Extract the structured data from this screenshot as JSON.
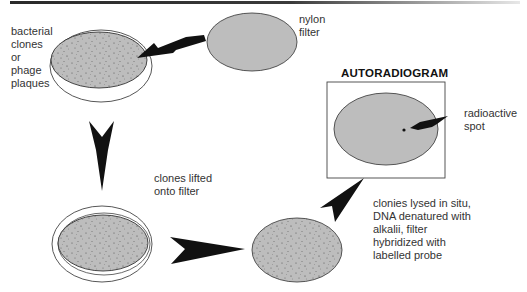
{
  "diagram": {
    "type": "process-flow",
    "labels": {
      "plate": "bacterial\nclones\nor\nphage\nplaques",
      "filter": "nylon\nfilter",
      "lift": "clones lifted\nonto filter",
      "process": "clonies lysed in situ,\nDNA denatured with\nalkalii, filter\nhybridized with\nlabelled probe",
      "autoradiogram_title": "AUTORADIOGRAM",
      "spot": "radioactive\nspot"
    },
    "nodes": [
      {
        "id": "plate-top",
        "name": "petri dish with bacterial clones or phage plaques"
      },
      {
        "id": "nylon-filter",
        "name": "nylon filter"
      },
      {
        "id": "plate-bottom",
        "name": "petri dish with filter (clones lifted)"
      },
      {
        "id": "filter-processed",
        "name": "hybridized filter"
      },
      {
        "id": "autoradiogram",
        "name": "autoradiogram with radioactive spot"
      }
    ],
    "edges": [
      {
        "from": "nylon-filter",
        "to": "plate-top"
      },
      {
        "from": "plate-top",
        "to": "plate-bottom",
        "label": "clones lifted onto filter"
      },
      {
        "from": "plate-bottom",
        "to": "filter-processed"
      },
      {
        "from": "filter-processed",
        "to": "autoradiogram",
        "label": "clonies lysed in situ, DNA denatured with alkalii, filter hybridized with labelled probe"
      }
    ],
    "colors": {
      "filter_fill": "#bdbdbd",
      "outline": "#333333",
      "arrow": "#111111",
      "text": "#333333"
    }
  }
}
